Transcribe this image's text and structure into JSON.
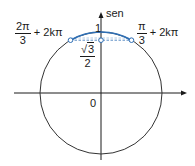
{
  "diagram": {
    "type": "unit-circle",
    "axis_label_vertical": "sen",
    "origin_label": "0",
    "top_value_label": "1",
    "left_point": {
      "num": "2π",
      "den": "3",
      "suffix": "+ 2kπ"
    },
    "right_point": {
      "num": "π",
      "den": "3",
      "suffix": "+ 2kπ"
    },
    "sine_value": {
      "num_radical": "3",
      "num_sqrt_symbol": "√",
      "den": "2"
    },
    "colors": {
      "circle": "#333333",
      "highlight_arc": "#2e6fb5",
      "dashed_line": "#2e6fb5",
      "point_fill": "#ffffff",
      "point_stroke": "#2e6fb5",
      "axes": "#1a1a1a"
    }
  }
}
